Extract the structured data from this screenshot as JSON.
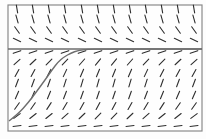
{
  "diagram": {
    "type": "slope-field",
    "frame": {
      "x": 8,
      "y": 5,
      "width": 194,
      "height": 126
    },
    "colors": {
      "background": "#fefefe",
      "frame": "#8a8a8a",
      "segments": "#2e2e2e",
      "curve": "#6d6d6d"
    },
    "grid": {
      "columns_x": [
        17,
        33,
        49,
        65,
        82,
        98,
        114,
        130,
        146,
        162,
        178,
        194
      ],
      "rows": [
        {
          "y": 9,
          "slope": -6.0
        },
        {
          "y": 19,
          "slope": -3.5
        },
        {
          "y": 30,
          "slope": -1.4
        },
        {
          "y": 40,
          "slope": -0.45
        },
        {
          "y": 52,
          "slope": 0.35
        },
        {
          "y": 62,
          "slope": 0.9
        },
        {
          "y": 73,
          "slope": 1.8
        },
        {
          "y": 83,
          "slope": 2.6
        },
        {
          "y": 95,
          "slope": 2.2
        },
        {
          "y": 106,
          "slope": 1.4
        },
        {
          "y": 116,
          "slope": 0.75
        },
        {
          "y": 126,
          "slope": 0.12
        }
      ],
      "segment_length": 8
    },
    "equilibrium": {
      "y": 49,
      "label": ""
    },
    "solution_curve": {
      "points": [
        [
          9,
          121
        ],
        [
          18,
          114
        ],
        [
          28,
          103
        ],
        [
          37,
          91
        ],
        [
          45,
          80
        ],
        [
          52,
          70
        ],
        [
          58,
          62
        ],
        [
          64,
          57
        ],
        [
          71,
          53
        ],
        [
          78,
          50.5
        ],
        [
          88,
          49.3
        ],
        [
          100,
          49
        ],
        [
          202,
          49
        ]
      ]
    }
  }
}
